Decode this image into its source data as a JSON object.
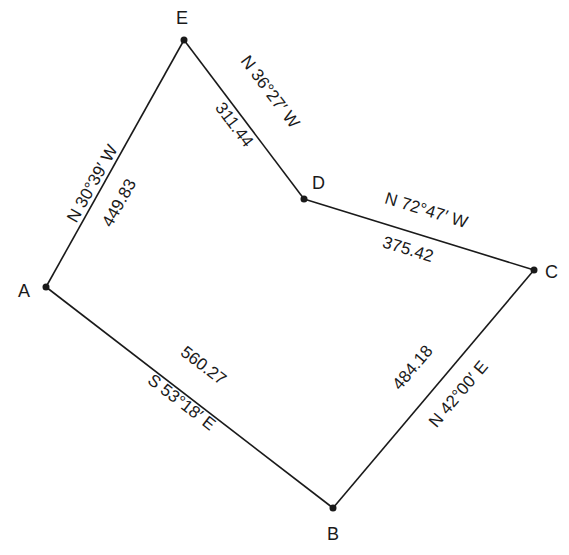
{
  "diagram": {
    "type": "traverse-survey",
    "points": [
      {
        "name": "A",
        "x": 46,
        "y": 287
      },
      {
        "name": "B",
        "x": 333,
        "y": 508
      },
      {
        "name": "C",
        "x": 534,
        "y": 270
      },
      {
        "name": "D",
        "x": 304,
        "y": 199
      },
      {
        "name": "E",
        "x": 184,
        "y": 40
      }
    ],
    "legs": [
      {
        "from": "A",
        "to": "B",
        "bearing": "S 53°18′ E",
        "distance": "560.27"
      },
      {
        "from": "B",
        "to": "C",
        "bearing": "N 42°00′ E",
        "distance": "484.18"
      },
      {
        "from": "C",
        "to": "D",
        "bearing": "N 72°47′ W",
        "distance": "375.42"
      },
      {
        "from": "D",
        "to": "E",
        "bearing": "N 36°27′ W",
        "distance": "311.44"
      },
      {
        "from": "E",
        "to": "A",
        "bearing": "N 30°39′ W",
        "distance": "449.83"
      }
    ]
  },
  "labels": {
    "A": "A",
    "B": "B",
    "C": "C",
    "D": "D",
    "E": "E",
    "ab_bearing": "S 53°18′ E",
    "ab_distance": "560.27",
    "bc_bearing": "N 42°00′ E",
    "bc_distance": "484.18",
    "cd_bearing": "N 72°47′ W",
    "cd_distance": "375.42",
    "de_bearing": "N 36°27′ W",
    "de_distance": "311.44",
    "ea_bearing": "N 30°39′ W",
    "ea_distance": "449.83"
  }
}
